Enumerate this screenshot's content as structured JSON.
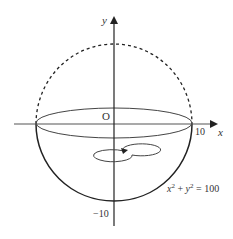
{
  "diagram": {
    "type": "hemisphere-of-revolution",
    "axes": {
      "x_label": "x",
      "y_label": "y",
      "origin_label": "O"
    },
    "ticks": {
      "x_right": "10",
      "y_bottom": "−10"
    },
    "equation": {
      "lhs_x": "x",
      "exp1": "2",
      "plus": " + ",
      "lhs_y": "y",
      "exp2": "2",
      "rhs": " = 100"
    },
    "circle": {
      "radius": 10,
      "upper_half_style": "dashed",
      "lower_half_style": "solid"
    },
    "rotation_indicator": "counterclockwise arrow about y-axis",
    "colors": {
      "stroke": "#222222",
      "label": "#333333",
      "background": "#ffffff"
    }
  }
}
